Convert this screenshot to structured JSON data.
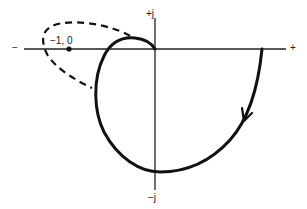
{
  "diagram": {
    "type": "nyquist-plot",
    "axes": {
      "real_negative_label": "−",
      "real_positive_label": "+",
      "imag_positive_label": "+j",
      "imag_negative_label": "−j"
    },
    "critical_point": {
      "label": "−1, 0"
    },
    "curves": [
      {
        "name": "solid-locus",
        "style": "solid",
        "has_direction_arrow": true
      },
      {
        "name": "dashed-locus",
        "style": "dashed"
      }
    ],
    "colors": {
      "line": "#111111",
      "background": "#ffffff"
    }
  }
}
